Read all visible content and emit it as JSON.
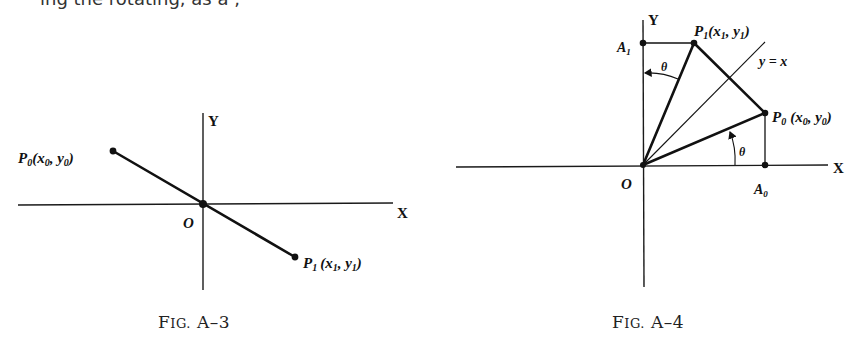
{
  "page": {
    "clipped_top_text": "ing the rotating, as a ,"
  },
  "figures": [
    {
      "id": "fig-a3",
      "caption": {
        "prefix_big": "F",
        "prefix_small": "IG.",
        "number": " A–3"
      },
      "axes": {
        "x_label": "X",
        "y_label": "Y",
        "origin_label": "O"
      },
      "points": [
        {
          "name": "P0",
          "label": "P",
          "sub": "0",
          "coords": "(x",
          "coords_sub0": "0",
          "coords_mid": ", y",
          "coords_sub1": "0",
          "coords_end": ")"
        },
        {
          "name": "P1",
          "label": "P",
          "sub": "1",
          "coords": "(x",
          "coords_sub0": "1",
          "coords_mid": ", y",
          "coords_sub1": "1",
          "coords_end": ")"
        }
      ],
      "description": "Line segment from P0 in second quadrant through origin O to P1 in fourth quadrant"
    },
    {
      "id": "fig-a4",
      "caption": {
        "prefix_big": "F",
        "prefix_small": "IG.",
        "number": " A–4"
      },
      "axes": {
        "x_label": "X",
        "y_label": "Y",
        "origin_label": "O"
      },
      "points": [
        {
          "name": "P1",
          "label": "P",
          "sub": "1",
          "coords": "(x",
          "coords_sub0": "1",
          "coords_mid": ", y",
          "coords_sub1": "1",
          "coords_end": ")"
        },
        {
          "name": "P0",
          "label": "P",
          "sub": "0",
          "coords": "(x",
          "coords_sub0": "0",
          "coords_mid": ", y",
          "coords_sub1": "0",
          "coords_end": ")"
        },
        {
          "name": "A1",
          "label": "A",
          "sub": "1"
        },
        {
          "name": "A0",
          "label": "A",
          "sub": "0"
        }
      ],
      "line_label": "y = x",
      "angle_label": "θ",
      "description": "Reflection of P0 across line y = x gives P1; angle θ between OP0 and X axis equals angle between OP1 and Y axis"
    }
  ]
}
